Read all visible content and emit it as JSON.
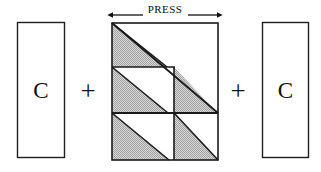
{
  "figure": {
    "background_color": "#ffffff",
    "line_color": "#1a1a1a",
    "hatch_color": "#b9b9b9",
    "hatch_background": "#d8d8d8"
  },
  "dimension_label": {
    "text": "PRESS",
    "arrow_style": "double-headed",
    "left_arrow_x": 112,
    "right_arrow_x": 218,
    "y": 15
  },
  "operators": [
    {
      "name": "plus-left",
      "symbol": "+"
    },
    {
      "name": "plus-right",
      "symbol": "+"
    }
  ],
  "side_blocks": [
    {
      "name": "left-block",
      "label": "C",
      "x": 17,
      "y": 22,
      "width": 48,
      "height": 136,
      "filled": false
    },
    {
      "name": "right-block",
      "label": "C",
      "x": 262,
      "y": 22,
      "width": 47,
      "height": 136,
      "filled": false
    }
  ],
  "press_block": {
    "name": "press-panel",
    "x": 112,
    "y": 23,
    "width": 106,
    "height": 137,
    "major_diagonal": {
      "from": [
        112,
        23
      ],
      "to": [
        218,
        113
      ]
    },
    "dividers": [
      {
        "orientation": "horizontal",
        "y": 67,
        "x1": 112,
        "x2": 175
      },
      {
        "orientation": "horizontal",
        "y": 113,
        "x1": 112,
        "x2": 218
      },
      {
        "orientation": "vertical",
        "x": 174,
        "y1": 67,
        "y2": 160
      }
    ],
    "cells": [
      {
        "name": "cell-top-left",
        "x1": 112,
        "y1": 23,
        "x2": 175,
        "y2": 67,
        "shaded_half": "lower-left"
      },
      {
        "name": "cell-middle-left",
        "x1": 112,
        "y1": 67,
        "x2": 175,
        "y2": 113,
        "shaded_half": "lower-left"
      },
      {
        "name": "cell-middle-right",
        "x1": 174,
        "y1": 67,
        "x2": 218,
        "y2": 113,
        "shaded_half": "lower-left"
      },
      {
        "name": "cell-bottom-left",
        "x1": 112,
        "y1": 113,
        "x2": 175,
        "y2": 160,
        "shaded_half": "lower-left"
      },
      {
        "name": "cell-bottom-right",
        "x1": 174,
        "y1": 113,
        "x2": 218,
        "y2": 160,
        "shaded_half": "lower-left"
      }
    ]
  }
}
